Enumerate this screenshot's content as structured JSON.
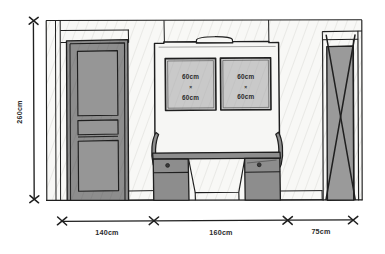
{
  "drawing": {
    "type": "interior-elevation-sketch",
    "title_visible": false,
    "colors": {
      "ink": "#1f1f1f",
      "wall_fill": "#f7f7f5",
      "door_fill": "#8d8d8d",
      "panel_fill": "#c9c9c9",
      "furniture_fill": "#8d8d8d",
      "window_fill": "#9a9a9a",
      "paper": "#ffffff"
    }
  },
  "dimensions": {
    "vertical": {
      "label": "260cm",
      "position": "left",
      "orientation": "rotated-vertical"
    },
    "horizontal": [
      {
        "label": "140cm",
        "segment": "door-bay"
      },
      {
        "label": "160cm",
        "segment": "center-unit-bay"
      },
      {
        "label": "75cm",
        "segment": "right-window-bay"
      }
    ]
  },
  "elements": {
    "door": {
      "name": "paneled-door",
      "panels": 3
    },
    "center_unit": {
      "name": "wall-unit-with-desk",
      "mirror_panels": [
        {
          "width_label": "60cm",
          "times": "×",
          "height_label": "60cm"
        },
        {
          "width_label": "60cm",
          "times": "×",
          "height_label": "60cm"
        }
      ],
      "drawers": 2,
      "knobs": 2
    },
    "window": {
      "name": "tall-cross-braced-window",
      "marking": "X-brace"
    },
    "tick_marks": {
      "style": "x-cross",
      "count_horizontal": 4,
      "count_vertical": 2
    }
  }
}
